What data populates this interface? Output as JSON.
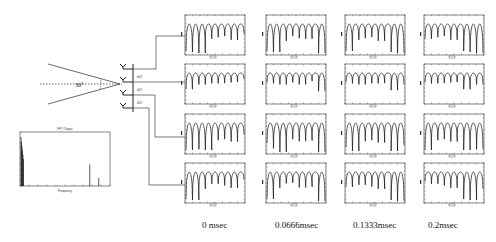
{
  "figure": {
    "array_geometry": {
      "angle_label": "30°",
      "spacing_labels": [
        "d/2",
        "d/2",
        "d/2"
      ],
      "antenna_count": 4
    },
    "spectrum_inset": {
      "title": "FFT Output",
      "xlabel": "Frequency",
      "ylabel": ""
    },
    "columns": [
      {
        "time_label": "0 msec"
      },
      {
        "time_label": "0.0666msec"
      },
      {
        "time_label": "0.1333msec"
      },
      {
        "time_label": "0.2msec"
      }
    ],
    "rows": 4
  },
  "chart_data": [
    {
      "type": "bar",
      "title": "FFT Output",
      "xlabel": "Frequency",
      "ylabel": "",
      "description": "Small spectrum inset with a large cluster near the origin and two isolated spectral lines",
      "x": [
        0.5,
        1,
        15.5,
        17.5
      ],
      "values": [
        0.9,
        0.45,
        0.4,
        0.15
      ],
      "ylim": [
        0,
        1
      ],
      "xlim": [
        0,
        20
      ],
      "grid": false
    },
    {
      "type": "line",
      "title": "Received waveform grid (4 antennas x 4 time instants)",
      "columns": [
        "0 msec",
        "0.0666msec",
        "0.1333msec",
        "0.2msec"
      ],
      "rows": [
        "Antenna 1",
        "Antenna 2",
        "Antenna 3",
        "Antenna 4"
      ],
      "description": "Each panel shows a periodic arch-shaped (rectified) waveform with ~9 lobes and deep nulls; minima depth varies by antenna row",
      "lobes_per_panel": 9,
      "grid": false
    }
  ]
}
